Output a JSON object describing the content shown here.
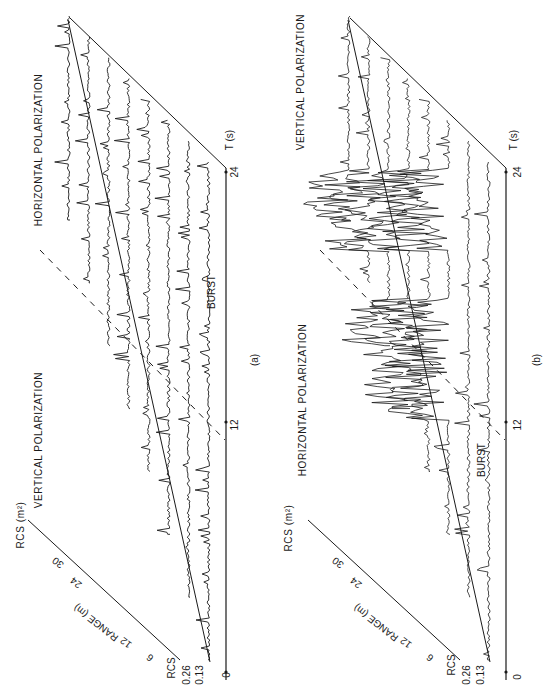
{
  "figure": {
    "orientation": "rotated-90-ccw",
    "ink_color": "#1a1a1a",
    "background": "#ffffff"
  },
  "panels": [
    {
      "id": "a",
      "caption": "(a)",
      "left_title": "VERTICAL POLARIZATION",
      "right_title": "HORIZONTAL POLARIZATION",
      "rcs_axis_label": "RCS (m²)",
      "rcs_scale_label": "RCS",
      "rcs_ticks": [
        "0.26",
        "0.13"
      ],
      "range_axis_label": "RANGE (m)",
      "range_ticks": [
        "6",
        "12",
        "24",
        "30"
      ],
      "time_axis_label": "T (s)",
      "time_ticks": [
        "0",
        "12",
        "24"
      ],
      "annotation": "BURST"
    },
    {
      "id": "b",
      "caption": "(b)",
      "left_title": "HORIZONTAL POLARIZATION",
      "right_title": "VERTICAL POLARIZATION",
      "rcs_axis_label": "RCS (m²)",
      "rcs_scale_label": "RCS",
      "rcs_ticks": [
        "0.26",
        "0.13"
      ],
      "range_axis_label": "RANGE (m)",
      "range_ticks": [
        "6",
        "12",
        "24",
        "30"
      ],
      "time_axis_label": "T (s)",
      "time_ticks": [
        "0",
        "12",
        "24"
      ],
      "annotation": "BURST"
    }
  ],
  "chart_data": [
    {
      "type": "line",
      "title": "(a)",
      "subtitle_left": "VERTICAL POLARIZATION",
      "subtitle_right": "HORIZONTAL POLARIZATION",
      "xlabel": "T (s)",
      "ylabel": "RCS (m²)",
      "zlabel": "RANGE (m)",
      "x_ticks": [
        0,
        12,
        24
      ],
      "y_ticks": [
        0.13,
        0.26
      ],
      "z_ticks": [
        6,
        12,
        24,
        30
      ],
      "xlim": [
        0,
        24
      ],
      "series_count": 8,
      "annotations": [
        "BURST"
      ],
      "notes": "Waterfall of RCS traces vs time at successive range bins; polarization switch marked by dashed diagonal near T≈12-14 s"
    },
    {
      "type": "line",
      "title": "(b)",
      "subtitle_left": "HORIZONTAL POLARIZATION",
      "subtitle_right": "VERTICAL POLARIZATION",
      "xlabel": "T (s)",
      "ylabel": "RCS (m²)",
      "zlabel": "RANGE (m)",
      "x_ticks": [
        0,
        12,
        24
      ],
      "y_ticks": [
        0.13,
        0.26
      ],
      "z_ticks": [
        6,
        12,
        24,
        30
      ],
      "xlim": [
        0,
        24
      ],
      "series_count": 8,
      "annotations": [
        "BURST"
      ],
      "notes": "Waterfall of RCS traces vs time at successive range bins; strong clutter bursts in vertical polarization section"
    }
  ]
}
